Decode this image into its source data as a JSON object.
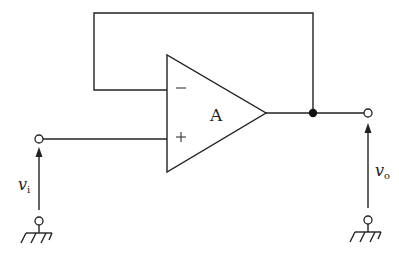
{
  "diagram": {
    "type": "circuit",
    "title": "",
    "amplifier": {
      "label": "A",
      "inverting_input_symbol": "−",
      "non_inverting_input_symbol": "+"
    },
    "input": {
      "label_main": "v",
      "label_sub": "i"
    },
    "output": {
      "label_main": "v",
      "label_sub": "o"
    },
    "colors": {
      "line": "#222222",
      "background": "#ffffff"
    },
    "nodes": [
      {
        "id": "input-terminal",
        "type": "open-terminal"
      },
      {
        "id": "output-terminal",
        "type": "open-terminal"
      },
      {
        "id": "output-junction",
        "type": "junction-dot"
      },
      {
        "id": "input-ground",
        "type": "ground"
      },
      {
        "id": "output-ground",
        "type": "ground"
      }
    ],
    "connections": [
      "output-junction -> feedback loop -> inverting input (−)",
      "input-terminal -> non-inverting input (+)",
      "amplifier output -> output-junction -> output-terminal"
    ]
  }
}
